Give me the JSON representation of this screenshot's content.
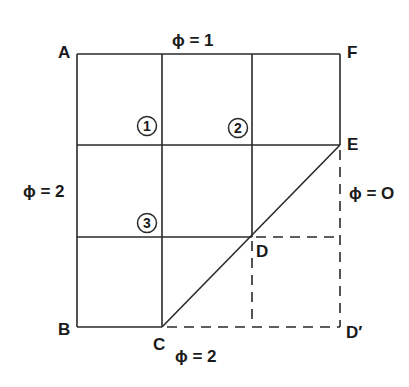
{
  "figure": {
    "points": {
      "A": "A",
      "B": "B",
      "C": "C",
      "D": "D",
      "D_prime": "D′",
      "E": "E",
      "F": "F"
    },
    "boundary_labels": {
      "top": "ϕ = 1",
      "left": "ϕ = 2",
      "right": "ϕ = O",
      "bottom": "ϕ = 2"
    },
    "nodes": [
      {
        "id": "node-1",
        "label": "1"
      },
      {
        "id": "node-2",
        "label": "2"
      },
      {
        "id": "node-3",
        "label": "3"
      }
    ],
    "colors": {
      "line": "#2a2a2a",
      "text": "#1a1a1a",
      "background": "#ffffff"
    }
  }
}
